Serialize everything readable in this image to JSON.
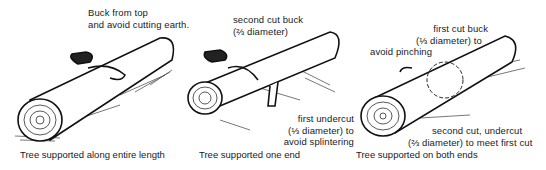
{
  "panels": [
    {
      "caption": "Tree supported along entire length",
      "note": [
        "Buck from top",
        "and avoid cutting earth."
      ]
    },
    {
      "caption": "Tree supported one end",
      "note_top": [
        "second cut buck",
        "(⅔ diameter)"
      ],
      "note_bottom": [
        "first undercut",
        "(⅓ diameter) to",
        "avoid splintering"
      ]
    },
    {
      "caption": "Tree supported on both ends",
      "note_top": [
        "first cut buck",
        "(⅓ diameter) to",
        "avoid pinching"
      ],
      "note_bottom": [
        "second cut, undercut",
        "(⅔ diameter) to meet first cut"
      ]
    }
  ]
}
